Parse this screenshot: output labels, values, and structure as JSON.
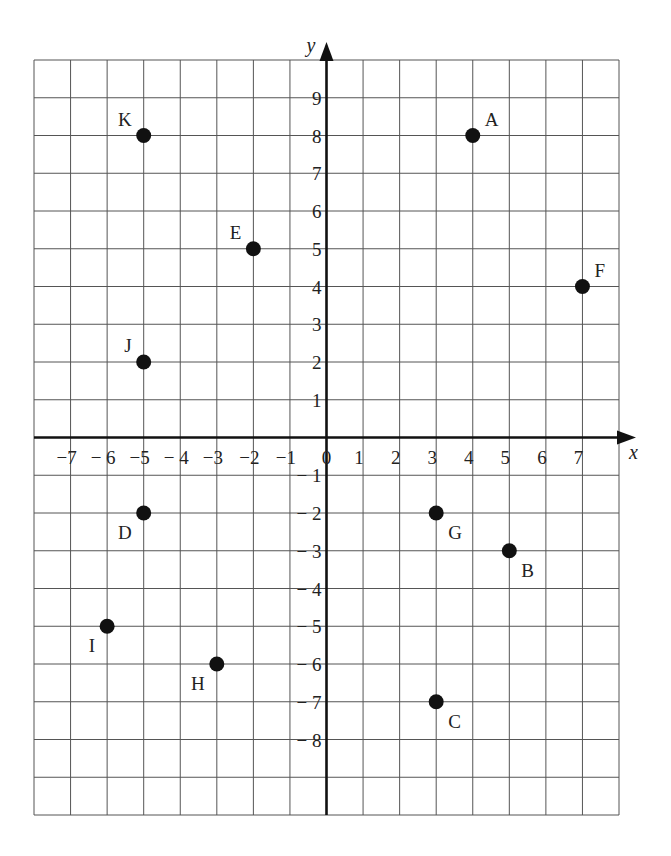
{
  "chart_data": {
    "type": "scatter",
    "title": "",
    "xlabel": "x",
    "ylabel": "y",
    "xlim": [
      -8,
      8
    ],
    "ylim": [
      -10,
      10
    ],
    "grid": true,
    "x_ticks": [
      -7,
      -6,
      -5,
      -4,
      -3,
      -2,
      -1,
      0,
      1,
      2,
      3,
      4,
      5,
      6,
      7
    ],
    "x_tick_labels": [
      "−7",
      "− 6",
      "−5",
      "− 4",
      "−3",
      "−2",
      "−1",
      "0",
      "1",
      "2",
      "3",
      "4",
      "5",
      "6",
      "7"
    ],
    "y_ticks": [
      9,
      8,
      7,
      6,
      5,
      4,
      3,
      2,
      1,
      -1,
      -2,
      -3,
      -4,
      -5,
      -6,
      -7,
      -8
    ],
    "y_tick_labels": [
      "9",
      "8",
      "7",
      "6",
      "5",
      "4",
      "3",
      "2",
      "1",
      "− 1",
      "− 2",
      "− 3",
      "− 4",
      "− 5",
      "− 6",
      "− 7",
      "− 8"
    ],
    "points": [
      {
        "label": "A",
        "x": 4,
        "y": 8,
        "label_pos": "ne"
      },
      {
        "label": "B",
        "x": 5,
        "y": -3,
        "label_pos": "se"
      },
      {
        "label": "C",
        "x": 3,
        "y": -7,
        "label_pos": "se"
      },
      {
        "label": "D",
        "x": -5,
        "y": -2,
        "label_pos": "sw"
      },
      {
        "label": "E",
        "x": -2,
        "y": 5,
        "label_pos": "nw"
      },
      {
        "label": "F",
        "x": 7,
        "y": 4,
        "label_pos": "ne"
      },
      {
        "label": "G",
        "x": 3,
        "y": -2,
        "label_pos": "se"
      },
      {
        "label": "H",
        "x": -3,
        "y": -6,
        "label_pos": "sw"
      },
      {
        "label": "I",
        "x": -6,
        "y": -5,
        "label_pos": "sw"
      },
      {
        "label": "J",
        "x": -5,
        "y": 2,
        "label_pos": "nw"
      },
      {
        "label": "K",
        "x": -5,
        "y": 8,
        "label_pos": "nw"
      }
    ]
  },
  "colors": {
    "grid": "#555555",
    "axis": "#111111",
    "point": "#111111",
    "background": "#ffffff"
  }
}
